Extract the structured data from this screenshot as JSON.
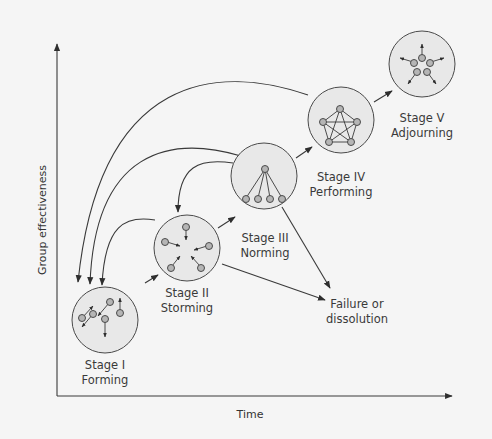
{
  "diagram": {
    "x_axis_label": "Time",
    "y_axis_label": "Group effectiveness",
    "stages": [
      {
        "id": "stage-1",
        "title": "Stage I",
        "name": "Forming",
        "structure": "scattered-individuals"
      },
      {
        "id": "stage-2",
        "title": "Stage II",
        "name": "Storming",
        "structure": "converging-conflict"
      },
      {
        "id": "stage-3",
        "title": "Stage III",
        "name": "Norming",
        "structure": "hierarchy"
      },
      {
        "id": "stage-4",
        "title": "Stage IV",
        "name": "Performing",
        "structure": "fully-connected"
      },
      {
        "id": "stage-5",
        "title": "Stage V",
        "name": "Adjourning",
        "structure": "dispersing"
      }
    ],
    "failure": {
      "line1": "Failure or",
      "line2": "dissolution"
    },
    "forward_arrows": [
      {
        "from": "Stage I",
        "to": "Stage II"
      },
      {
        "from": "Stage II",
        "to": "Stage III"
      },
      {
        "from": "Stage III",
        "to": "Stage IV"
      },
      {
        "from": "Stage IV",
        "to": "Stage V"
      }
    ],
    "regression_arrows": [
      {
        "from": "Stage II",
        "to": "Stage I"
      },
      {
        "from": "Stage III",
        "to": "Stage I"
      },
      {
        "from": "Stage III",
        "to": "Stage II"
      },
      {
        "from": "Stage IV",
        "to": "Stage I"
      }
    ],
    "failure_arrows": [
      {
        "from": "Stage II",
        "to": "Failure or dissolution"
      },
      {
        "from": "Stage III",
        "to": "Failure or dissolution"
      }
    ]
  }
}
